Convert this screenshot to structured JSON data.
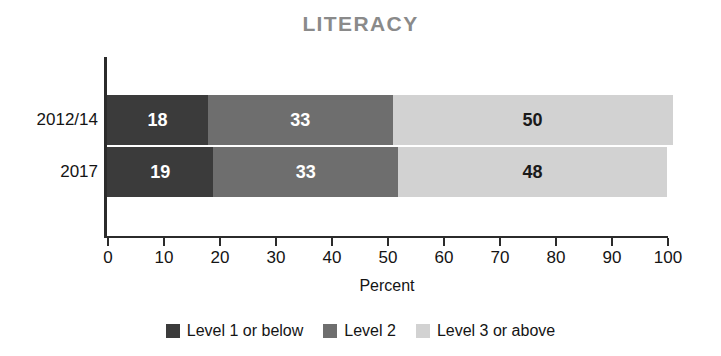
{
  "chart_data": {
    "type": "bar",
    "orientation": "horizontal",
    "stacked": true,
    "normalized_percent": true,
    "title": "LITERACY",
    "xlabel": "Percent",
    "ylabel": "",
    "categories": [
      "2012/14",
      "2017"
    ],
    "xlim": [
      0,
      100
    ],
    "xticks": [
      0,
      10,
      20,
      30,
      40,
      50,
      60,
      70,
      80,
      90,
      100
    ],
    "xtick_labels": [
      "0",
      "10",
      "20",
      "30",
      "40",
      "50",
      "60",
      "70",
      "80",
      "90",
      "100"
    ],
    "grid": false,
    "legend_position": "bottom",
    "series": [
      {
        "name": "Level 1 or below",
        "color": "#3b3b3b",
        "label_color": "#ffffff",
        "values": [
          18,
          19
        ]
      },
      {
        "name": "Level 2",
        "color": "#6e6e6e",
        "label_color": "#ffffff",
        "values": [
          33,
          33
        ]
      },
      {
        "name": "Level 3 or above",
        "color": "#d2d2d2",
        "label_color": "#1a1a1a",
        "values": [
          50,
          48
        ]
      }
    ],
    "data_labels": [
      [
        "18",
        "33",
        "50"
      ],
      [
        "19",
        "33",
        "48"
      ]
    ],
    "colors": {
      "title": "#8a8a8a",
      "axis": "#2b2b2b",
      "text": "#141414",
      "level1": "#3b3b3b",
      "level2": "#6e6e6e",
      "level3": "#d2d2d2",
      "background": "#ffffff"
    }
  },
  "legend": {
    "items": [
      {
        "label": "Level 1 or below",
        "color": "#3b3b3b"
      },
      {
        "label": "Level 2",
        "color": "#6e6e6e"
      },
      {
        "label": "Level 3 or above",
        "color": "#d2d2d2"
      }
    ]
  }
}
